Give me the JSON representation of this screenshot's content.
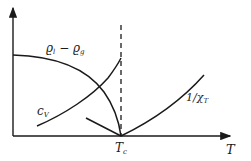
{
  "diagram": {
    "type": "phase-transition-sketch",
    "colors": {
      "ink": "#1a1a1a",
      "background": "#ffffff"
    },
    "axes": {
      "x_label": "T",
      "critical_marker": "Tc",
      "critical_marker_main": "T",
      "critical_marker_sub": "c"
    },
    "curves": [
      {
        "id": "density-difference",
        "label_main": "ϱ",
        "label_sub1": "l",
        "label_minus": " − ",
        "label_main2": "ϱ",
        "label_sub2": "g",
        "label": "ϱl − ϱg"
      },
      {
        "id": "specific-heat",
        "label_main": "c",
        "label_sub": "V",
        "label": "cV"
      },
      {
        "id": "inverse-compressibility",
        "label_main": "1/χ",
        "label_sub": "T",
        "label": "1/χT"
      }
    ],
    "reference_line": {
      "style": "dashed",
      "at": "Tc"
    }
  }
}
